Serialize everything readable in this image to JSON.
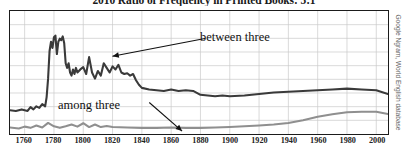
{
  "title": "2010 Ratio of Frequency in Printed Books: 5:1",
  "credit": "Google Ngram, World English database",
  "annotations": {
    "upper": "between three",
    "lower": "among three"
  },
  "chart_data": {
    "type": "line",
    "title": "2010 Ratio of Frequency in Printed Books: 5:1",
    "xlabel": "",
    "ylabel": "",
    "xlim": [
      1750,
      2008
    ],
    "ylim": [
      0,
      8
    ],
    "grid": true,
    "legend_position": "inline-annotations",
    "xticks": [
      1760,
      1780,
      1800,
      1820,
      1840,
      1860,
      1880,
      1900,
      1920,
      1940,
      1960,
      1980,
      2000
    ],
    "gridlines_horizontal": 8,
    "series": [
      {
        "name": "between three",
        "color": "#3a3a3a",
        "x": [
          1750,
          1754,
          1758,
          1762,
          1764,
          1766,
          1768,
          1770,
          1772,
          1774,
          1775,
          1776,
          1777,
          1778,
          1779,
          1780,
          1781,
          1782,
          1783,
          1784,
          1785,
          1786,
          1787,
          1788,
          1789,
          1790,
          1791,
          1792,
          1793,
          1794,
          1795,
          1796,
          1798,
          1800,
          1802,
          1804,
          1806,
          1808,
          1810,
          1812,
          1814,
          1816,
          1818,
          1820,
          1822,
          1824,
          1826,
          1828,
          1830,
          1832,
          1834,
          1836,
          1838,
          1840,
          1845,
          1850,
          1855,
          1860,
          1865,
          1870,
          1875,
          1880,
          1885,
          1890,
          1895,
          1900,
          1910,
          1920,
          1930,
          1940,
          1950,
          1960,
          1970,
          1980,
          1990,
          2000,
          2008
        ],
        "values": [
          1.55,
          1.5,
          1.6,
          1.5,
          1.75,
          1.6,
          1.8,
          1.7,
          1.95,
          1.8,
          2.4,
          3.6,
          5.4,
          6.0,
          5.6,
          6.3,
          6.4,
          5.2,
          6.0,
          6.2,
          6.1,
          6.35,
          5.9,
          4.6,
          4.3,
          4.6,
          4.0,
          3.8,
          4.2,
          3.9,
          4.3,
          4.0,
          4.2,
          4.35,
          3.9,
          5.0,
          4.0,
          3.6,
          4.1,
          3.8,
          4.6,
          4.3,
          4.0,
          4.4,
          4.2,
          4.5,
          4.0,
          3.9,
          3.95,
          3.8,
          3.9,
          3.5,
          3.2,
          3.0,
          2.9,
          2.85,
          2.8,
          2.9,
          2.8,
          2.85,
          2.8,
          2.55,
          2.5,
          2.45,
          2.5,
          2.45,
          2.5,
          2.6,
          2.7,
          2.75,
          2.8,
          2.85,
          2.9,
          2.95,
          2.9,
          2.85,
          2.6
        ]
      },
      {
        "name": "among three",
        "color": "#8f8f8f",
        "x": [
          1750,
          1756,
          1760,
          1764,
          1768,
          1772,
          1776,
          1780,
          1784,
          1788,
          1792,
          1796,
          1800,
          1804,
          1808,
          1812,
          1816,
          1820,
          1830,
          1840,
          1850,
          1860,
          1870,
          1880,
          1890,
          1900,
          1910,
          1920,
          1930,
          1940,
          1950,
          1960,
          1970,
          1980,
          1990,
          2000,
          2008
        ],
        "values": [
          0.42,
          0.36,
          0.48,
          0.4,
          0.55,
          0.42,
          0.72,
          0.5,
          0.4,
          0.5,
          0.62,
          0.48,
          0.7,
          0.45,
          0.62,
          0.45,
          0.52,
          0.45,
          0.42,
          0.4,
          0.4,
          0.42,
          0.4,
          0.4,
          0.42,
          0.45,
          0.5,
          0.55,
          0.62,
          0.72,
          0.9,
          1.12,
          1.28,
          1.42,
          1.45,
          1.45,
          1.3
        ]
      }
    ]
  }
}
